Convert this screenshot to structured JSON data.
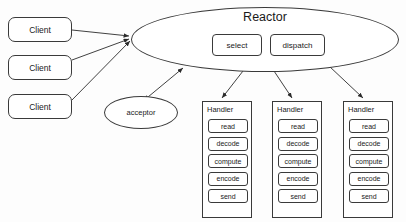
{
  "diagram": {
    "colors": {
      "background": "#fdfdfd",
      "stroke": "#3a3a3a",
      "fill": "#ffffff",
      "text": "#1a1a1a"
    },
    "clients": [
      {
        "label": "Client"
      },
      {
        "label": "Client"
      },
      {
        "label": "Client"
      }
    ],
    "reactor": {
      "label": "Reactor",
      "operations": [
        {
          "label": "select"
        },
        {
          "label": "dispatch"
        }
      ]
    },
    "acceptor": {
      "label": "acceptor"
    },
    "handlers": [
      {
        "label": "Handler",
        "steps": [
          {
            "label": "read"
          },
          {
            "label": "decode"
          },
          {
            "label": "compute"
          },
          {
            "label": "encode"
          },
          {
            "label": "send"
          }
        ]
      },
      {
        "label": "Handler",
        "steps": [
          {
            "label": "read"
          },
          {
            "label": "decode"
          },
          {
            "label": "compute"
          },
          {
            "label": "encode"
          },
          {
            "label": "send"
          }
        ]
      },
      {
        "label": "Handler",
        "steps": [
          {
            "label": "read"
          },
          {
            "label": "decode"
          },
          {
            "label": "compute"
          },
          {
            "label": "encode"
          },
          {
            "label": "send"
          }
        ]
      }
    ],
    "edges": [
      {
        "name": "client-1-to-reactor",
        "arrow": "single"
      },
      {
        "name": "client-2-to-reactor",
        "arrow": "single"
      },
      {
        "name": "client-3-to-reactor",
        "arrow": "single"
      },
      {
        "name": "acceptor-reactor",
        "arrow": "double"
      },
      {
        "name": "reactor-to-handler-1",
        "arrow": "single"
      },
      {
        "name": "reactor-to-handler-2",
        "arrow": "single"
      },
      {
        "name": "reactor-to-handler-3",
        "arrow": "single"
      }
    ]
  }
}
